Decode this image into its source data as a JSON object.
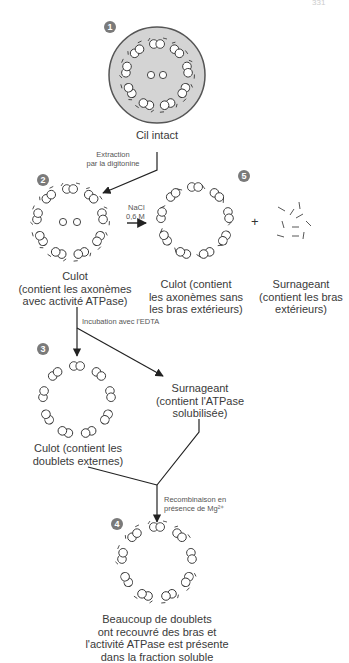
{
  "page_number": "331",
  "steps": [
    {
      "id": 1,
      "badge": "1",
      "caption": [
        "Cil intact"
      ]
    },
    {
      "id": 2,
      "badge": "2",
      "caption": [
        "Culot",
        "(contient les axonèmes",
        "avec activité ATPase)"
      ]
    },
    {
      "id": 5,
      "badge": "5",
      "caption_pellet": [
        "Culot (contient",
        "les axonèmes sans",
        "les bras extérieurs)"
      ],
      "caption_supernatant": [
        "Surnageant",
        "(contient les bras",
        "extérieurs)"
      ]
    },
    {
      "id": 3,
      "badge": "3",
      "caption": [
        "Culot (contient les",
        "doublets externes)"
      ]
    },
    {
      "id": "3b",
      "caption": [
        "Surnageant",
        "(contient l'ATPase",
        "solubilisée)"
      ]
    },
    {
      "id": 4,
      "badge": "4",
      "caption": [
        "Beaucoup de doublets",
        "ont recouvré des bras et",
        "l'activité ATPase est présente",
        "dans la fraction soluble"
      ]
    }
  ],
  "arrows": {
    "extraction": [
      "Extraction",
      "par la digitonine"
    ],
    "nacl": [
      "NaCl",
      "0,6 M"
    ],
    "plus": "+",
    "edta": "Incubation avec l'EDTA",
    "recombination": [
      "Recombinaison en",
      "présence de Mg²⁺"
    ]
  },
  "colors": {
    "badge": "#7a7a7a",
    "cilium_fill": "#d4d4d4",
    "line": "#222222",
    "text": "#3a3a3a"
  }
}
